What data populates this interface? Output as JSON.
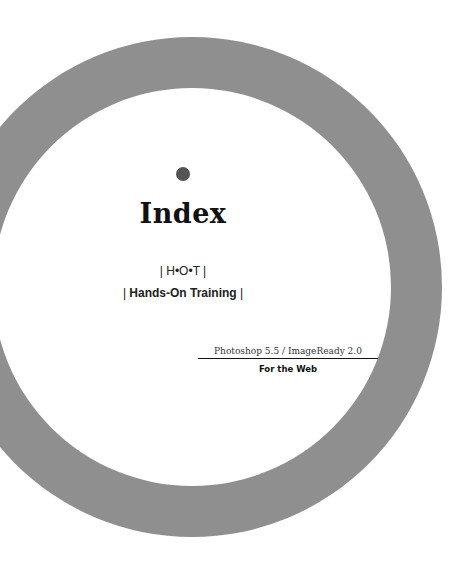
{
  "page": {
    "title": "Index",
    "series_mark": "| H•O•T |",
    "series_name_prefix": "| ",
    "series_name": "Hands-On Training",
    "series_name_suffix": " |",
    "edition": "Photoshop 5.5 / ImageReady 2.0",
    "subtitle": "For the Web"
  },
  "colors": {
    "ring": "#8f8f8f",
    "dot": "#555555",
    "background": "#ffffff",
    "text": "#111111"
  },
  "decorations": {
    "ring_icon": "large-gray-ring",
    "dot_icon": "bullet-dot"
  }
}
